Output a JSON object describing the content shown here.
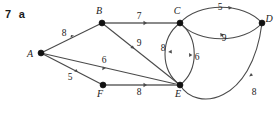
{
  "figure": {
    "problem_number": "7",
    "problem_part": "a",
    "type": "weighted-graph-diagram"
  },
  "graph": {
    "nodes": [
      {
        "id": "A",
        "label": "A",
        "x": 41,
        "y": 53,
        "label_x": 30,
        "label_y": 57
      },
      {
        "id": "B",
        "label": "B",
        "x": 102,
        "y": 23,
        "label_x": 98,
        "label_y": 14
      },
      {
        "id": "C",
        "label": "C",
        "x": 180,
        "y": 23,
        "label_x": 176,
        "label_y": 14
      },
      {
        "id": "D",
        "label": "D",
        "x": 262,
        "y": 23,
        "label_x": 268,
        "label_y": 21
      },
      {
        "id": "E",
        "label": "E",
        "x": 180,
        "y": 85,
        "label_x": 177,
        "label_y": 97
      },
      {
        "id": "F",
        "label": "F",
        "x": 103,
        "y": 85,
        "label_x": 99,
        "label_y": 97
      }
    ],
    "edges": [
      {
        "from": "A",
        "to": "B",
        "weight": "8",
        "label_x": 64,
        "label_y": 36,
        "shape": "line"
      },
      {
        "from": "B",
        "to": "C",
        "weight": "7",
        "label_x": 139,
        "label_y": 19,
        "shape": "line"
      },
      {
        "from": "B",
        "to": "E",
        "weight": "9",
        "label_x": 139,
        "label_y": 46,
        "shape": "line"
      },
      {
        "from": "A",
        "to": "E",
        "weight": "6",
        "label_x": 104,
        "label_y": 63,
        "shape": "line"
      },
      {
        "from": "A",
        "to": "F",
        "weight": "5",
        "label_x": 70,
        "label_y": 80,
        "shape": "line"
      },
      {
        "from": "F",
        "to": "E",
        "weight": "8",
        "label_x": 139,
        "label_y": 95,
        "shape": "line"
      },
      {
        "from": "C",
        "to": "E",
        "weight": "8",
        "label_x": 163,
        "label_y": 51,
        "shape": "arc-left"
      },
      {
        "from": "C",
        "to": "E",
        "weight": "6",
        "label_x": 197,
        "label_y": 60,
        "shape": "arc-right"
      },
      {
        "from": "C",
        "to": "D",
        "weight": "5",
        "label_x": 220,
        "label_y": 10,
        "shape": "arc-top"
      },
      {
        "from": "C",
        "to": "D",
        "weight": "9",
        "label_x": 224,
        "label_y": 40,
        "shape": "arc-bottom"
      },
      {
        "from": "E",
        "to": "D",
        "weight": "8",
        "label_x": 254,
        "label_y": 95,
        "shape": "arc-outer"
      }
    ]
  },
  "colors": {
    "background": "#ffffff",
    "edge": "#4a4a4a",
    "edge_highlight": "#8a8a8a",
    "node": "#111111",
    "text": "#1a1a1a"
  }
}
